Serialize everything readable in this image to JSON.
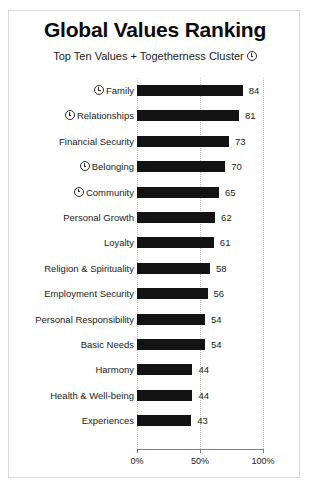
{
  "chart_data": {
    "type": "bar",
    "orientation": "horizontal",
    "title": "Global Values Ranking",
    "subtitle": "Top Ten Values + Togetherness Cluster",
    "xlabel": "",
    "ylabel": "",
    "xlim": [
      0,
      100
    ],
    "xticks": [
      0,
      50,
      100
    ],
    "xtick_labels": [
      "0%",
      "50%",
      "100%"
    ],
    "grid": true,
    "grid_axis": "x",
    "legend": "none",
    "bar_color": "#131313",
    "categories": [
      "Family",
      "Relationships",
      "Financial Security",
      "Belonging",
      "Community",
      "Personal Growth",
      "Loyalty",
      "Religion & Spirituality",
      "Employment Security",
      "Personal Responsibility",
      "Basic Needs",
      "Harmony",
      "Health & Well-being",
      "Experiences"
    ],
    "values": [
      84,
      81,
      73,
      70,
      65,
      62,
      61,
      58,
      56,
      54,
      54,
      44,
      44,
      43
    ],
    "value_labels": [
      "84",
      "81",
      "73",
      "70",
      "65",
      "62",
      "61",
      "58",
      "56",
      "54",
      "54",
      "44",
      "44",
      "43"
    ],
    "cluster_marked": [
      true,
      true,
      false,
      true,
      true,
      false,
      false,
      false,
      false,
      false,
      false,
      false,
      false,
      false
    ],
    "cluster_marker_name": "togetherness-cluster-icon"
  },
  "rows": [
    {
      "label": "Family",
      "value": 84,
      "value_label": "84",
      "marked": true
    },
    {
      "label": "Relationships",
      "value": 81,
      "value_label": "81",
      "marked": true
    },
    {
      "label": "Financial Security",
      "value": 73,
      "value_label": "73",
      "marked": false
    },
    {
      "label": "Belonging",
      "value": 70,
      "value_label": "70",
      "marked": true
    },
    {
      "label": "Community",
      "value": 65,
      "value_label": "65",
      "marked": true
    },
    {
      "label": "Personal Growth",
      "value": 62,
      "value_label": "62",
      "marked": false
    },
    {
      "label": "Loyalty",
      "value": 61,
      "value_label": "61",
      "marked": false
    },
    {
      "label": "Religion & Spirituality",
      "value": 58,
      "value_label": "58",
      "marked": false
    },
    {
      "label": "Employment Security",
      "value": 56,
      "value_label": "56",
      "marked": false
    },
    {
      "label": "Personal Responsibility",
      "value": 54,
      "value_label": "54",
      "marked": false
    },
    {
      "label": "Basic Needs",
      "value": 54,
      "value_label": "54",
      "marked": false
    },
    {
      "label": "Harmony",
      "value": 44,
      "value_label": "44",
      "marked": false
    },
    {
      "label": "Health & Well-being",
      "value": 44,
      "value_label": "44",
      "marked": false
    },
    {
      "label": "Experiences",
      "value": 43,
      "value_label": "43",
      "marked": false
    }
  ],
  "axis": {
    "ticks": [
      {
        "label": "0%",
        "value": 0
      },
      {
        "label": "50%",
        "value": 50
      },
      {
        "label": "100%",
        "value": 100
      }
    ]
  }
}
